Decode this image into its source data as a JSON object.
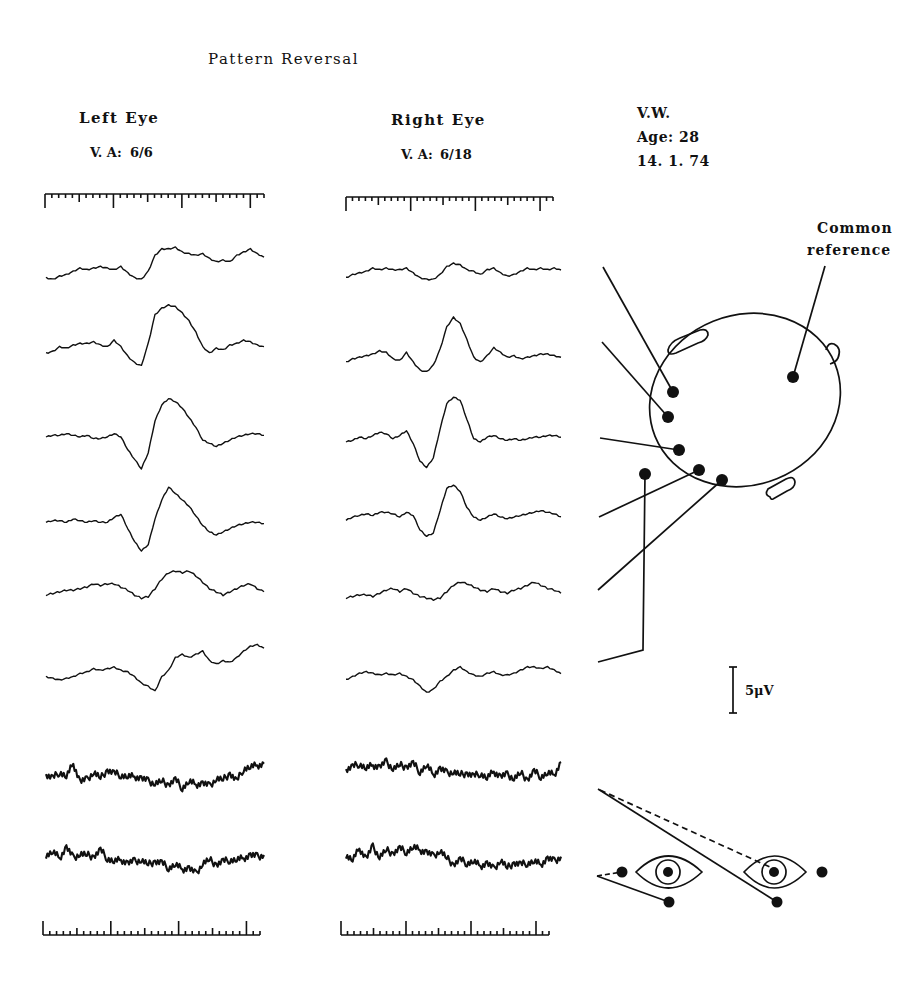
{
  "title": "Pattern Reversal",
  "left_eye": {
    "heading": "Left Eye",
    "va_label": "V. A:",
    "va_value": "6/6"
  },
  "right_eye": {
    "heading": "Right Eye",
    "va_label": "V. A:",
    "va_value": "6/18"
  },
  "patient": {
    "initials": "V.W.",
    "age": "Age: 28",
    "date": "14. 1. 74"
  },
  "montage": {
    "reference_label_line1": "Common",
    "reference_label_line2": "reference"
  },
  "scale_bar": {
    "label": "5μV"
  },
  "colors": {
    "ink": "#111111",
    "paper": "#ffffff"
  },
  "chart_data": {
    "type": "line",
    "title": "Pattern Reversal",
    "columns": [
      "Left Eye",
      "Right Eye"
    ],
    "scale": "5μV",
    "x": [
      0,
      1,
      2,
      3,
      4,
      5,
      6,
      7,
      8,
      9,
      10,
      11,
      12,
      13,
      14,
      15,
      16,
      17,
      18,
      19,
      20,
      21,
      22,
      23,
      24,
      25,
      26,
      27,
      28,
      29,
      30,
      31,
      32
    ],
    "left_eye_traces": [
      {
        "name": "ch1",
        "values": [
          0,
          -1,
          1,
          2,
          4,
          6,
          5,
          6,
          7,
          6,
          5,
          7,
          3,
          0,
          -1,
          4,
          14,
          18,
          18,
          19,
          16,
          15,
          14,
          15,
          12,
          10,
          11,
          10,
          14,
          16,
          18,
          15,
          13
        ]
      },
      {
        "name": "ch2",
        "values": [
          0,
          1,
          4,
          3,
          5,
          6,
          6,
          7,
          5,
          4,
          8,
          4,
          -2,
          -6,
          -8,
          6,
          24,
          28,
          30,
          29,
          25,
          20,
          13,
          4,
          0,
          3,
          2,
          5,
          6,
          8,
          7,
          5,
          4
        ]
      },
      {
        "name": "ch3",
        "values": [
          0,
          1,
          1,
          2,
          1,
          0,
          1,
          -1,
          -1,
          0,
          2,
          0,
          -8,
          -14,
          -20,
          -10,
          10,
          20,
          24,
          22,
          18,
          12,
          6,
          -2,
          -4,
          -6,
          -4,
          -2,
          0,
          1,
          2,
          2,
          1
        ]
      },
      {
        "name": "ch4",
        "values": [
          0,
          1,
          1,
          0,
          2,
          1,
          0,
          1,
          0,
          0,
          3,
          5,
          -4,
          -12,
          -18,
          -14,
          2,
          14,
          22,
          18,
          14,
          10,
          4,
          -2,
          -6,
          -8,
          -6,
          -4,
          -2,
          -1,
          0,
          0,
          -1
        ]
      },
      {
        "name": "ch5",
        "values": [
          0,
          1,
          2,
          3,
          3,
          4,
          5,
          7,
          6,
          7,
          7,
          5,
          3,
          0,
          -2,
          -1,
          4,
          10,
          14,
          15,
          14,
          15,
          12,
          8,
          4,
          2,
          0,
          2,
          4,
          6,
          7,
          4,
          2
        ]
      },
      {
        "name": "ch6",
        "values": [
          0,
          -1,
          -2,
          -1,
          0,
          2,
          3,
          5,
          4,
          5,
          6,
          4,
          3,
          0,
          -4,
          -6,
          -9,
          0,
          4,
          12,
          14,
          12,
          14,
          16,
          10,
          8,
          10,
          9,
          12,
          16,
          19,
          20,
          18
        ]
      },
      {
        "name": "ch7",
        "values": [
          0,
          -2,
          2,
          -1,
          7,
          -4,
          -3,
          2,
          -2,
          3,
          1,
          0,
          -1,
          -1,
          -2,
          -4,
          -5,
          -4,
          -6,
          -3,
          -8,
          -4,
          -6,
          -5,
          -7,
          -2,
          -3,
          1,
          -4,
          4,
          5,
          6,
          7
        ]
      },
      {
        "name": "ch8",
        "values": [
          0,
          2,
          -2,
          5,
          -2,
          1,
          0,
          -1,
          3,
          -2,
          -4,
          -3,
          -5,
          -4,
          -3,
          -6,
          -4,
          -5,
          -8,
          -6,
          -9,
          -8,
          -12,
          -5,
          -3,
          -6,
          -4,
          -3,
          -3,
          -2,
          0,
          -1,
          0
        ]
      }
    ],
    "right_eye_traces": [
      {
        "name": "ch1",
        "values": [
          0,
          2,
          3,
          4,
          6,
          5,
          6,
          5,
          5,
          6,
          3,
          0,
          -1,
          -1,
          2,
          7,
          9,
          8,
          5,
          4,
          2,
          5,
          6,
          3,
          1,
          2,
          4,
          6,
          5,
          6,
          5,
          6,
          5
        ]
      },
      {
        "name": "ch2",
        "values": [
          0,
          2,
          3,
          4,
          5,
          7,
          6,
          2,
          1,
          6,
          0,
          -5,
          -6,
          -2,
          8,
          22,
          28,
          24,
          14,
          3,
          0,
          4,
          9,
          6,
          3,
          4,
          2,
          3,
          4,
          5,
          5,
          4,
          3
        ]
      },
      {
        "name": "ch3",
        "values": [
          0,
          1,
          3,
          2,
          4,
          6,
          5,
          2,
          4,
          7,
          -1,
          -12,
          -16,
          -10,
          8,
          24,
          28,
          26,
          14,
          2,
          0,
          3,
          4,
          2,
          1,
          2,
          1,
          2,
          3,
          3,
          4,
          4,
          3
        ]
      },
      {
        "name": "ch4",
        "values": [
          0,
          2,
          3,
          4,
          3,
          5,
          5,
          4,
          2,
          5,
          3,
          -6,
          -10,
          -8,
          6,
          20,
          22,
          18,
          8,
          2,
          0,
          2,
          4,
          2,
          1,
          2,
          3,
          4,
          5,
          6,
          5,
          4,
          2
        ]
      },
      {
        "name": "ch5",
        "values": [
          0,
          1,
          2,
          2,
          1,
          3,
          5,
          6,
          4,
          6,
          3,
          1,
          0,
          -1,
          0,
          4,
          8,
          10,
          9,
          7,
          5,
          4,
          6,
          4,
          3,
          5,
          6,
          8,
          10,
          8,
          6,
          5,
          3
        ]
      },
      {
        "name": "ch6",
        "values": [
          0,
          2,
          4,
          5,
          4,
          3,
          4,
          3,
          4,
          2,
          0,
          -4,
          -8,
          -6,
          -1,
          2,
          6,
          8,
          5,
          3,
          2,
          4,
          5,
          3,
          3,
          4,
          6,
          8,
          8,
          7,
          8,
          6,
          4
        ]
      },
      {
        "name": "ch7",
        "values": [
          0,
          2,
          4,
          1,
          3,
          2,
          5,
          1,
          3,
          2,
          4,
          -1,
          3,
          -3,
          1,
          -2,
          -1,
          -3,
          -2,
          -4,
          -2,
          -5,
          -1,
          -4,
          -3,
          -5,
          -2,
          -6,
          -1,
          -4,
          -2,
          -3,
          5
        ]
      },
      {
        "name": "ch8",
        "values": [
          0,
          -3,
          4,
          -2,
          5,
          -1,
          3,
          1,
          4,
          2,
          5,
          3,
          2,
          -1,
          3,
          -2,
          -6,
          -3,
          -5,
          -4,
          -7,
          -5,
          -9,
          -3,
          -8,
          -5,
          -6,
          -5,
          -4,
          -6,
          -2,
          -4,
          -1
        ]
      }
    ]
  }
}
